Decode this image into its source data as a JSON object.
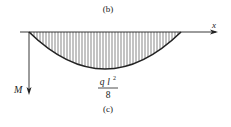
{
  "figure": {
    "top_caption": "(b)",
    "bottom_caption": "(c)",
    "x_axis_label": "x",
    "y_axis_label": "M",
    "max_moment": {
      "numerator_q": "q",
      "numerator_l": "l",
      "numerator_exp": "2",
      "denominator": "8"
    },
    "diagram_type": "bending-moment-diagram",
    "shape": "parabola",
    "colors": {
      "line": "#222222",
      "hatch": "#555555",
      "background": "#ffffff"
    }
  }
}
